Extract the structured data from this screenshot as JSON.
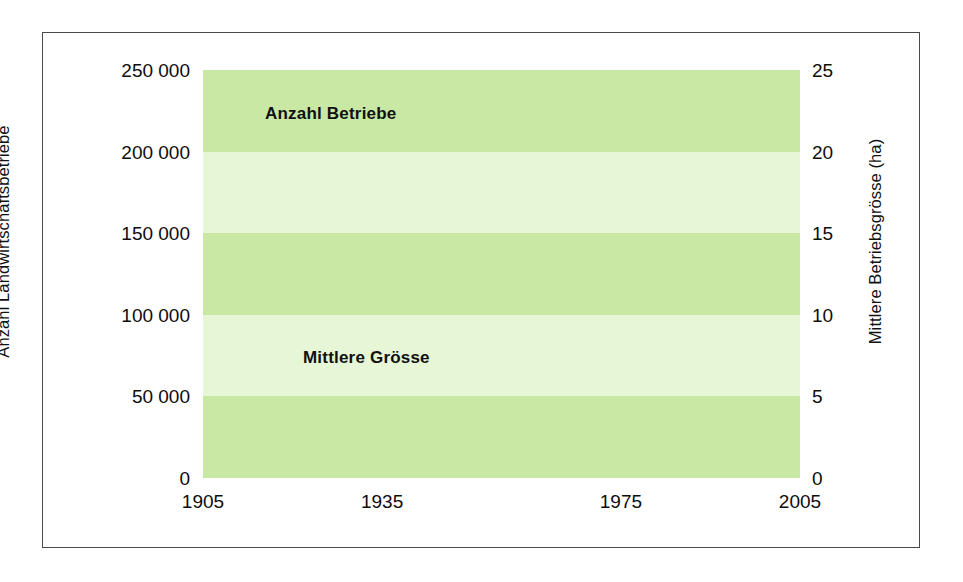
{
  "chart_data": {
    "type": "line",
    "title": "",
    "subtitle": "",
    "xlabel": "",
    "grid": false,
    "legend_position": "inline-annotations",
    "background_bands": true,
    "x": [
      1905,
      1915,
      1929,
      1939,
      1955,
      1965,
      1975,
      1985,
      1990,
      1996,
      2000,
      2005
    ],
    "xlim": [
      1905,
      2005
    ],
    "x_ticks": [
      "1905",
      "1935",
      "1975",
      "2005"
    ],
    "x_tick_values": [
      1905,
      1935,
      1975,
      2005
    ],
    "axes": {
      "left": {
        "label": "Anzahl Landwirtschaftsbetriebe",
        "ylim": [
          0,
          250000
        ],
        "ticks": [
          250000,
          200000,
          150000,
          100000,
          50000,
          0
        ],
        "tick_labels": [
          "250 000",
          "200 000",
          "150 000",
          "100 000",
          "50 000",
          "0"
        ]
      },
      "right": {
        "label": "Mittlere Betriebsgrösse (ha)",
        "ylim": [
          0,
          25
        ],
        "ticks": [
          25,
          20,
          15,
          10,
          5,
          0
        ],
        "tick_labels": [
          "25",
          "20",
          "15",
          "10",
          "5",
          "0"
        ]
      }
    },
    "series": [
      {
        "name": "Anzahl Betriebe",
        "axis": "left",
        "color": "#79bf47",
        "values": [
          243000,
          240000,
          237000,
          234000,
          205000,
          180000,
          145000,
          124000,
          119000,
          102000,
          79000,
          63000
        ]
      },
      {
        "name": "Mittlere Grösse",
        "axis": "right",
        "color": "#5f8a5c",
        "values": [
          4.5,
          4.7,
          4.9,
          5.1,
          5.4,
          6.1,
          7.2,
          8.4,
          10.2,
          12.4,
          14.6,
          16.7
        ]
      }
    ],
    "annotations": [
      {
        "text": "Anzahl Betriebe",
        "x": 1925,
        "y_left": 222000
      },
      {
        "text": "Mittlere Grösse",
        "x": 1931,
        "y_right": 8.2
      }
    ],
    "colors": {
      "band_dark": "#c9e8a4",
      "band_light": "#e6f6d6",
      "frame": "#4a4a4a",
      "page_background": "#ffffff",
      "text": "#0d0d0d",
      "series_green": "#79bf47",
      "series_gray_green": "#5f8a5c"
    }
  }
}
